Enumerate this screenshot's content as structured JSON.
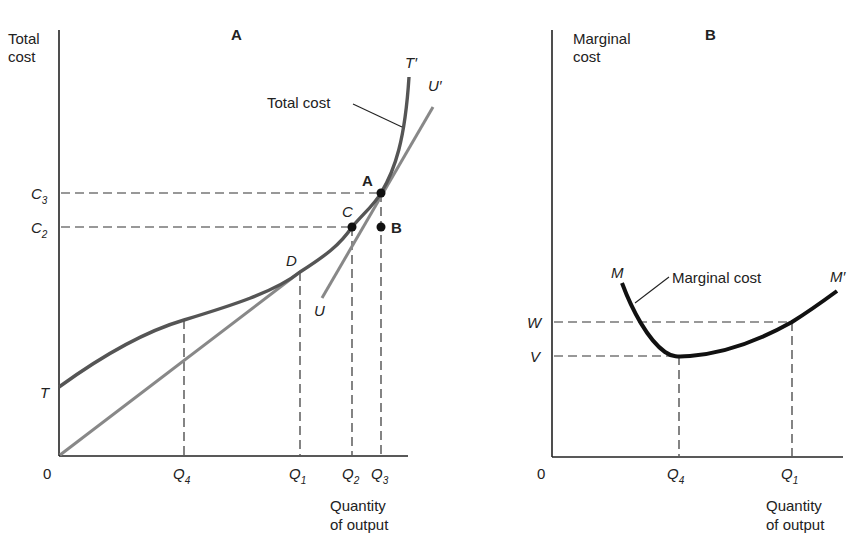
{
  "panels": {
    "a": {
      "title": "A",
      "y_axis_label_line1": "Total",
      "y_axis_label_line2": "cost",
      "x_axis_label_line1": "Quantity",
      "x_axis_label_line2": "of output",
      "origin": "0",
      "curve_label": "Total cost",
      "curve_start": "T",
      "curve_end": "T′",
      "tangent_start": "U",
      "tangent_end": "U′",
      "points": {
        "a": "A",
        "b": "B",
        "c": "C",
        "d": "D"
      },
      "y_ticks": [
        {
          "base": "C",
          "sub": "3"
        },
        {
          "base": "C",
          "sub": "2"
        }
      ],
      "x_ticks": [
        {
          "base": "Q",
          "sub": "4"
        },
        {
          "base": "Q",
          "sub": "1"
        },
        {
          "base": "Q",
          "sub": "2"
        },
        {
          "base": "Q",
          "sub": "3"
        }
      ]
    },
    "b": {
      "title": "B",
      "y_axis_label_line1": "Marginal",
      "y_axis_label_line2": "cost",
      "x_axis_label_line1": "Quantity",
      "x_axis_label_line2": "of output",
      "origin": "0",
      "curve_label": "Marginal cost",
      "curve_start": "M",
      "curve_end": "M′",
      "y_ticks": [
        {
          "base": "W"
        },
        {
          "base": "V"
        }
      ],
      "x_ticks": [
        {
          "base": "Q",
          "sub": "4"
        },
        {
          "base": "Q",
          "sub": "1"
        }
      ]
    }
  },
  "colors": {
    "axis": "#222222",
    "total_cost_curve": "#555555",
    "tangent_lines": "#888888",
    "marginal_cost_curve": "#111111",
    "dashed": "#333333",
    "points": "#111111"
  }
}
